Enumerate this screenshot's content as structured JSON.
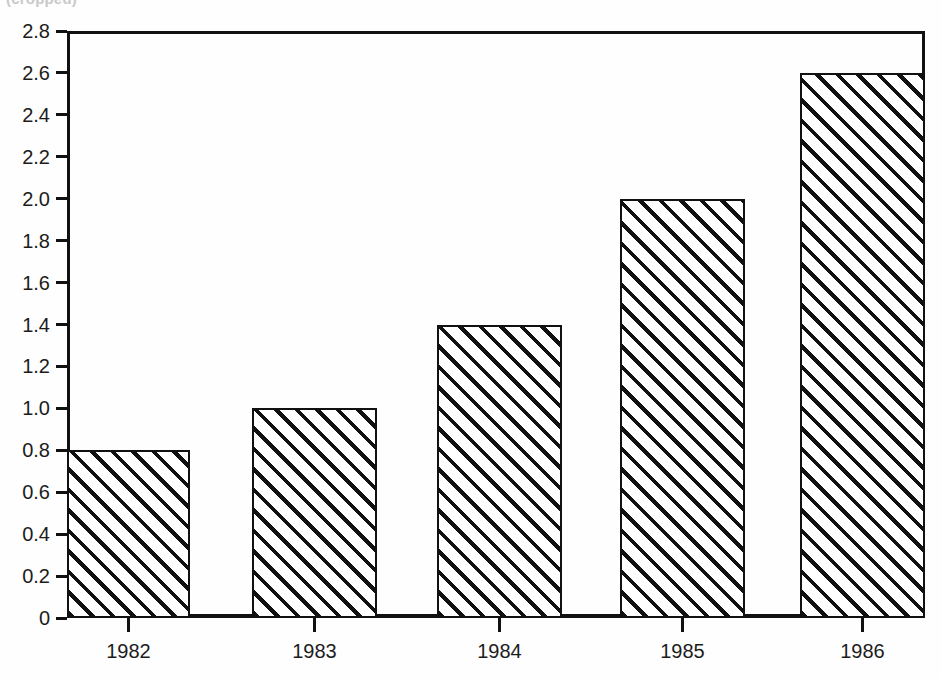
{
  "figure": {
    "title_partial": "(cropped)",
    "background_color": "#fefefe",
    "ink_color": "#111111"
  },
  "chart_data": {
    "type": "bar",
    "title": "",
    "xlabel": "",
    "ylabel": "",
    "categories": [
      "1982",
      "1983",
      "1984",
      "1985",
      "1986"
    ],
    "values": [
      0.8,
      1.0,
      1.4,
      2.0,
      2.6
    ],
    "ylim": [
      0,
      2.8
    ],
    "xlim": [
      1981.5,
      1986.5
    ],
    "ytick_labels": [
      "0",
      "0.2",
      "0.4",
      "0.6",
      "0.8",
      "1.0",
      "1.2",
      "1.4",
      "1.6",
      "1.8",
      "2.0",
      "2.2",
      "2.4",
      "2.6",
      "2.8"
    ],
    "ytick_values": [
      0,
      0.2,
      0.4,
      0.6,
      0.8,
      1.0,
      1.2,
      1.4,
      1.6,
      1.8,
      2.0,
      2.2,
      2.4,
      2.6,
      2.8
    ],
    "xtick_labels": [
      "1982",
      "1983",
      "1984",
      "1985",
      "1986"
    ],
    "grid": false,
    "legend": null,
    "bar_fill": "diagonal-hatch-45",
    "annotations": []
  },
  "axes": {
    "y": {
      "ticks": [
        {
          "label": "2.8",
          "value": 2.8
        },
        {
          "label": "2.6",
          "value": 2.6
        },
        {
          "label": "2.4",
          "value": 2.4
        },
        {
          "label": "2.2",
          "value": 2.2
        },
        {
          "label": "2.0",
          "value": 2.0
        },
        {
          "label": "1.8",
          "value": 1.8
        },
        {
          "label": "1.6",
          "value": 1.6
        },
        {
          "label": "1.4",
          "value": 1.4
        },
        {
          "label": "1.2",
          "value": 1.2
        },
        {
          "label": "1.0",
          "value": 1.0
        },
        {
          "label": "0.8",
          "value": 0.8
        },
        {
          "label": "0.6",
          "value": 0.6
        },
        {
          "label": "0.4",
          "value": 0.4
        },
        {
          "label": "0.2",
          "value": 0.2
        },
        {
          "label": "0",
          "value": 0
        }
      ]
    },
    "x": {
      "ticks": [
        {
          "label": "1982"
        },
        {
          "label": "1983"
        },
        {
          "label": "1984"
        },
        {
          "label": "1985"
        },
        {
          "label": "1986"
        }
      ]
    }
  },
  "bars": [
    {
      "category": "1982",
      "value": 0.8
    },
    {
      "category": "1983",
      "value": 1.0
    },
    {
      "category": "1984",
      "value": 1.4
    },
    {
      "category": "1985",
      "value": 2.0
    },
    {
      "category": "1986",
      "value": 2.6
    }
  ]
}
